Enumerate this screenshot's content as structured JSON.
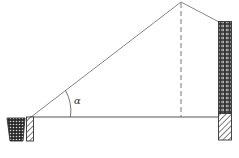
{
  "diagram": {
    "type": "geometry-figure",
    "labels": {
      "angle": "α"
    },
    "colors": {
      "line": "#555555",
      "dashed": "#555555",
      "fill_dark": "#333333",
      "background": "#ffffff"
    },
    "elements": [
      {
        "name": "ground-line",
        "from": [
          30,
          117
        ],
        "to": [
          219,
          117
        ]
      },
      {
        "name": "sight-line",
        "from": [
          31,
          117
        ],
        "to": [
          181,
          2
        ]
      },
      {
        "name": "descending-line",
        "from": [
          181,
          2
        ],
        "to": [
          219,
          22
        ]
      },
      {
        "name": "height-dashed-line",
        "from": [
          181,
          3
        ],
        "to": [
          181,
          117
        ]
      },
      {
        "name": "left-planter",
        "shape": "trapezoid"
      },
      {
        "name": "left-post",
        "pattern": "hatched"
      },
      {
        "name": "right-building-upper",
        "pattern": "dotted-grid"
      },
      {
        "name": "right-building-base",
        "pattern": "hatched"
      }
    ]
  }
}
